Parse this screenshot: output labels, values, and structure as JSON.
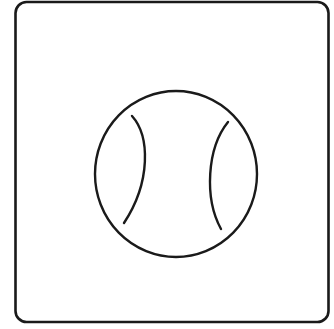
{
  "icon": {
    "name": "baseball-icon",
    "description": "Baseball / tennis ball line icon inside a rounded square",
    "colors": {
      "background": "#ffffff",
      "stroke": "#1a1a1a"
    }
  }
}
